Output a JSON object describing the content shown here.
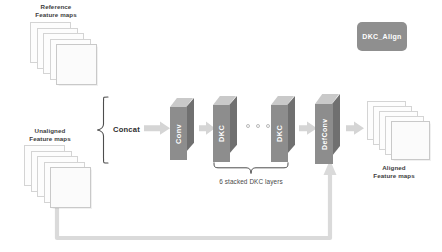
{
  "figure": {
    "legend_label": "DKC_Align"
  },
  "inputs": {
    "reference": {
      "label": "Reference\nFeature maps",
      "card_count": 5
    },
    "unaligned": {
      "label": "Unaligned\nFeature maps",
      "card_count": 5
    }
  },
  "operations": {
    "concat_label": "Concat",
    "bracket_note": "6 stacked DKC layers"
  },
  "blocks": [
    {
      "name": "conv",
      "label": "Conv"
    },
    {
      "name": "dkc_1",
      "label": "DKC"
    },
    {
      "name": "dkc_n",
      "label": "DKC"
    },
    {
      "name": "defconv",
      "label": "DefConv"
    }
  ],
  "ellipsis": {
    "dot_count": 3
  },
  "outputs": {
    "aligned": {
      "label": "Aligned\nFeature maps",
      "card_count": 5
    }
  },
  "colors": {
    "block_front": "#8c8c8c",
    "block_side": "#6f6f6f",
    "block_top": "#c8c8c8",
    "arrow": "#d3d3d3",
    "skip_line": "#d8d8d8",
    "text_dark": "#3c3c3c",
    "legend_bg": "#8f8f8f",
    "card_bg": "#fdfdfd",
    "card_border": "#d2d2d2"
  }
}
